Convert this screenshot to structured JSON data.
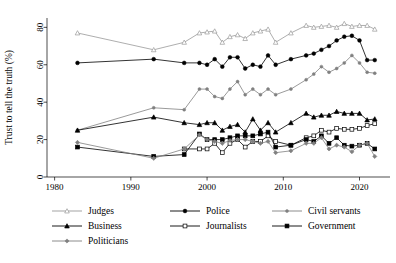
{
  "chart_data": {
    "type": "line",
    "title": "",
    "subtitle": "",
    "xlabel": "",
    "ylabel": "Trust to tell the truth (%)",
    "xlim": [
      1979,
      2024
    ],
    "ylim": [
      0,
      85
    ],
    "grid": false,
    "legend_position": "below-plot",
    "xticks": [
      "1980",
      "1990",
      "2000",
      "2010",
      "2020"
    ],
    "xtick_values": [
      1980,
      1990,
      2000,
      2010,
      2020
    ],
    "yticks": [
      "0",
      "20",
      "40",
      "60",
      "80"
    ],
    "ytick_values": [
      0,
      20,
      40,
      60,
      80
    ],
    "series": [
      {
        "name": "Judges",
        "color": "#999999",
        "marker": "triangle-open",
        "x": [
          1983,
          1993,
          1997,
          1999,
          2000,
          2001,
          2002,
          2003,
          2004,
          2005,
          2006,
          2007,
          2008,
          2009,
          2011,
          2013,
          2014,
          2015,
          2016,
          2017,
          2018,
          2019,
          2020,
          2021,
          2022
        ],
        "values": [
          77,
          68,
          72,
          77,
          77.5,
          78,
          72,
          75,
          76,
          74,
          77,
          78,
          79,
          72,
          77,
          81,
          80,
          80.5,
          81,
          80,
          82,
          80.5,
          81,
          81,
          79
        ]
      },
      {
        "name": "Police",
        "color": "#000000",
        "marker": "circle-filled",
        "x": [
          1983,
          1993,
          1997,
          1999,
          2000,
          2001,
          2002,
          2003,
          2004,
          2005,
          2006,
          2007,
          2008,
          2009,
          2011,
          2013,
          2014,
          2015,
          2016,
          2017,
          2018,
          2019,
          2020,
          2021,
          2022
        ],
        "values": [
          61,
          63,
          61,
          61,
          60,
          63,
          59,
          64,
          64,
          58,
          60,
          59,
          65,
          60,
          63,
          65,
          66,
          68,
          70,
          73,
          75,
          75.5,
          73,
          62.5,
          62.5
        ]
      },
      {
        "name": "Civil servants",
        "color": "#808080",
        "marker": "circle-small",
        "x": [
          1983,
          1993,
          1997,
          1999,
          2000,
          2001,
          2002,
          2003,
          2004,
          2005,
          2006,
          2007,
          2008,
          2009,
          2011,
          2013,
          2014,
          2015,
          2016,
          2017,
          2018,
          2019,
          2020,
          2021,
          2022
        ],
        "values": [
          25,
          37,
          36,
          47,
          47,
          43,
          42,
          47,
          51,
          44,
          47,
          44,
          47,
          44,
          47,
          52,
          55,
          59,
          56,
          58,
          61,
          65,
          61,
          56,
          55.5
        ]
      },
      {
        "name": "Business",
        "color": "#000000",
        "marker": "triangle-filled",
        "x": [
          1983,
          1993,
          1997,
          1999,
          2000,
          2001,
          2002,
          2003,
          2004,
          2005,
          2006,
          2007,
          2008,
          2009,
          2011,
          2013,
          2014,
          2015,
          2016,
          2017,
          2018,
          2019,
          2020,
          2021,
          2022
        ],
        "values": [
          25,
          32,
          29,
          28,
          29,
          29,
          25,
          27,
          28,
          24,
          31,
          25,
          29,
          24,
          29,
          34,
          32,
          33,
          33,
          35,
          34,
          34,
          34,
          30.5,
          31
        ]
      },
      {
        "name": "Journalists",
        "color": "#000000",
        "marker": "square-open",
        "x": [
          1997,
          1999,
          2000,
          2001,
          2002,
          2003,
          2004,
          2005,
          2006,
          2007,
          2008,
          2009,
          2011,
          2013,
          2014,
          2015,
          2016,
          2017,
          2018,
          2019,
          2020,
          2021,
          2022
        ],
        "values": [
          15,
          15,
          15,
          18,
          13,
          18,
          20,
          16,
          19,
          19,
          22,
          19,
          17,
          21,
          22,
          25,
          24,
          26,
          25.5,
          25.5,
          26,
          27.5,
          28.5
        ]
      },
      {
        "name": "Government",
        "color": "#000000",
        "marker": "square-filled",
        "x": [
          1983,
          1993,
          1997,
          1999,
          2000,
          2001,
          2002,
          2003,
          2004,
          2005,
          2006,
          2007,
          2008,
          2009,
          2011,
          2013,
          2014,
          2015,
          2016,
          2017,
          2018,
          2019,
          2020,
          2021,
          2022
        ],
        "values": [
          16,
          11,
          12,
          23,
          20,
          20,
          20,
          21,
          22,
          22,
          22,
          23,
          24,
          16,
          17,
          20,
          19,
          22,
          18,
          21,
          17,
          16.5,
          17,
          18,
          15
        ]
      },
      {
        "name": "Politicians",
        "color": "#808080",
        "marker": "diamond-filled",
        "x": [
          1983,
          1993,
          1997,
          1999,
          2000,
          2001,
          2002,
          2003,
          2004,
          2005,
          2006,
          2007,
          2008,
          2009,
          2011,
          2013,
          2014,
          2015,
          2016,
          2017,
          2018,
          2019,
          2020,
          2021,
          2022
        ],
        "values": [
          18.5,
          10,
          15,
          22.5,
          20,
          19,
          18,
          19.5,
          20,
          20,
          19,
          18,
          19,
          13,
          14,
          18,
          18,
          21,
          15,
          17,
          16,
          13.5,
          17,
          18,
          11
        ]
      }
    ]
  },
  "legend": {
    "entries": [
      {
        "label": "Judges",
        "color": "#999999",
        "marker": "triangle-open"
      },
      {
        "label": "Police",
        "color": "#000000",
        "marker": "circle-filled"
      },
      {
        "label": "Civil servants",
        "color": "#808080",
        "marker": "circle-small"
      },
      {
        "label": "Business",
        "color": "#000000",
        "marker": "triangle-filled"
      },
      {
        "label": "Journalists",
        "color": "#000000",
        "marker": "square-open"
      },
      {
        "label": "Government",
        "color": "#000000",
        "marker": "square-filled"
      },
      {
        "label": "Politicians",
        "color": "#808080",
        "marker": "diamond-filled"
      }
    ]
  },
  "colors": {
    "background": "#ffffff",
    "axis": "#000000",
    "text": "#000000"
  }
}
